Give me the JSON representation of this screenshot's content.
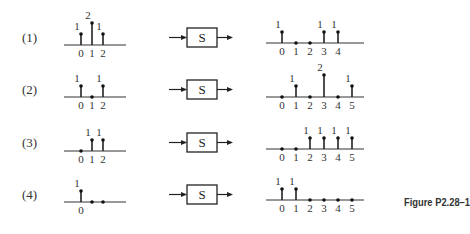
{
  "figure": {
    "caption": "Figure P2.28–1",
    "system_label": "S",
    "rows": [
      {
        "label": "(1)",
        "input": {
          "n": [
            0,
            1,
            2
          ],
          "values": [
            1,
            2,
            1
          ],
          "ticks": [
            "0",
            "1",
            "2"
          ]
        },
        "output": {
          "n": [
            0,
            1,
            2,
            3,
            4
          ],
          "values": [
            1,
            0,
            0,
            1,
            1
          ],
          "ticks": [
            "0",
            "1",
            "2",
            "3",
            "4"
          ]
        }
      },
      {
        "label": "(2)",
        "input": {
          "n": [
            0,
            1,
            2
          ],
          "values": [
            1,
            0,
            1
          ],
          "ticks": [
            "0",
            "1",
            "2"
          ]
        },
        "output": {
          "n": [
            0,
            1,
            2,
            3,
            4,
            5
          ],
          "values": [
            0,
            1,
            0,
            2,
            0,
            1
          ],
          "ticks": [
            "0",
            "1",
            "2",
            "3",
            "4",
            "5"
          ]
        }
      },
      {
        "label": "(3)",
        "input": {
          "n": [
            0,
            1,
            2
          ],
          "values": [
            0,
            1,
            1
          ],
          "ticks": [
            "0",
            "1",
            "2"
          ]
        },
        "output": {
          "n": [
            0,
            1,
            2,
            3,
            4,
            5
          ],
          "values": [
            0,
            0,
            1,
            1,
            1,
            1
          ],
          "ticks": [
            "0",
            "1",
            "2",
            "3",
            "4",
            "5"
          ]
        }
      },
      {
        "label": "(4)",
        "input": {
          "n": [
            0,
            1,
            2
          ],
          "values": [
            1,
            0,
            0
          ],
          "ticks": [
            "0",
            "",
            ""
          ]
        },
        "output": {
          "n": [
            0,
            1,
            2,
            3,
            4,
            5
          ],
          "values": [
            1,
            1,
            0,
            0,
            0,
            0
          ],
          "ticks": [
            "0",
            "1",
            "2",
            "3",
            "4",
            "5"
          ]
        }
      }
    ]
  }
}
